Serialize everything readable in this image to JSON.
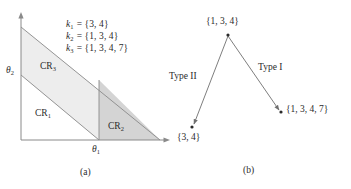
{
  "figure": {
    "panel_a": {
      "caption": "(a)",
      "axis_x_label": "θ",
      "axis_x_sub": "1",
      "axis_y_label": "θ",
      "axis_y_sub": "2",
      "legend": [
        {
          "symbol": "k",
          "sub": "1",
          "eq": "= {3, 4}"
        },
        {
          "symbol": "k",
          "sub": "2",
          "eq": "= {1, 3, 4}"
        },
        {
          "symbol": "k",
          "sub": "3",
          "eq": "= {1, 3, 4, 7}"
        }
      ],
      "regions": [
        {
          "name": "CR",
          "sub": "1",
          "fill": "#ffffff"
        },
        {
          "name": "CR",
          "sub": "2",
          "fill": "#d4d4d4"
        },
        {
          "name": "CR",
          "sub": "3",
          "fill": "#ededed"
        }
      ]
    },
    "panel_b": {
      "caption": "(b)",
      "nodes": [
        {
          "id": "apex",
          "label": "{1, 3, 4}"
        },
        {
          "id": "left",
          "label": "{3, 4}"
        },
        {
          "id": "right",
          "label": "{1, 3, 4, 7}"
        }
      ],
      "edges": [
        {
          "from": "apex",
          "to": "left",
          "label": "Type II"
        },
        {
          "from": "apex",
          "to": "right",
          "label": "Type I"
        }
      ]
    },
    "colors": {
      "stroke": "#8a8a8a",
      "text": "#2b2b2b",
      "shade_light": "#ededed",
      "shade_dark": "#d4d4d4"
    }
  }
}
